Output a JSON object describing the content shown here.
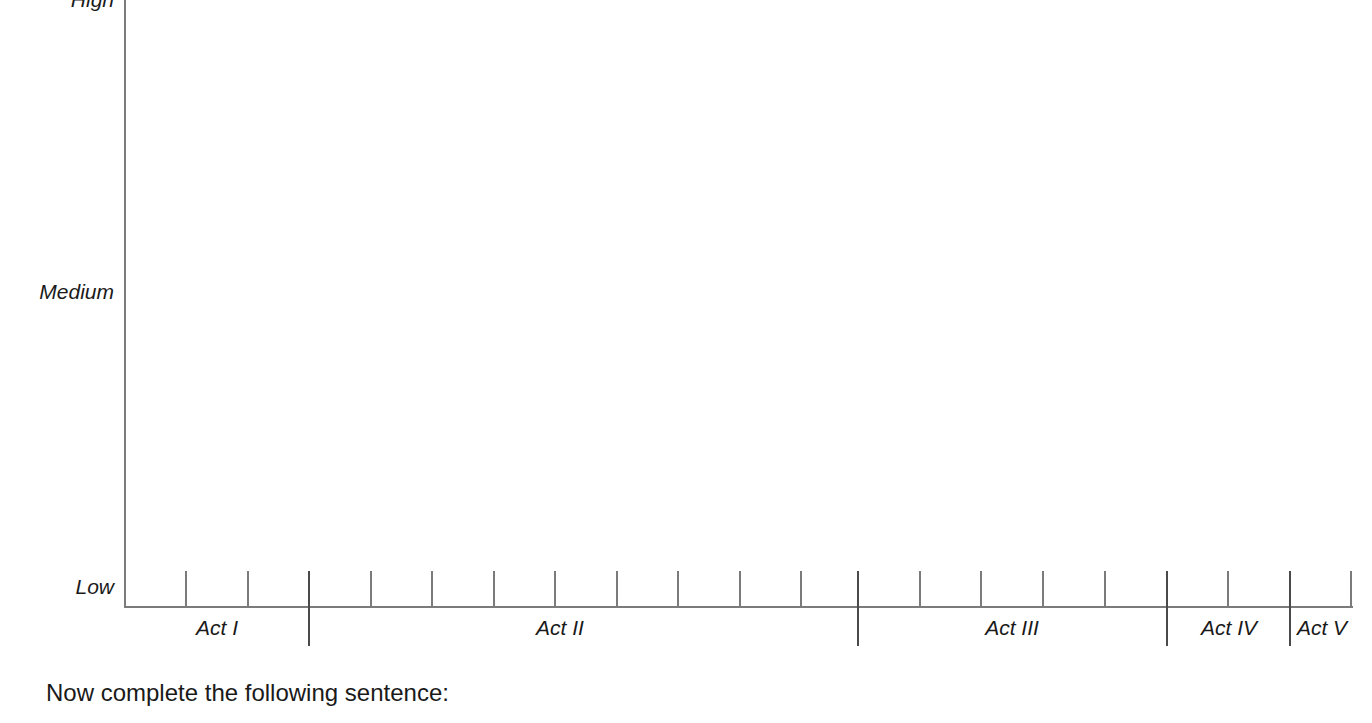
{
  "chart_data": {
    "type": "line",
    "title": "",
    "xlabel": "",
    "ylabel": "",
    "grid": false,
    "legend": null,
    "series": [],
    "y_axis": {
      "type": "categorical",
      "ticks": [
        {
          "label": "High",
          "value": 3
        },
        {
          "label": "Medium",
          "value": 2
        },
        {
          "label": "Low",
          "value": 1
        }
      ],
      "range": [
        "Low",
        "High"
      ]
    },
    "x_axis": {
      "type": "categorical",
      "label": "",
      "act_labels": [
        "Act I",
        "Act II",
        "Act III",
        "Act IV",
        "Act V"
      ],
      "minor_tick_count": 20,
      "act_boundaries": [
        "Act I/Act II",
        "Act II/Act III",
        "Act III/Act IV",
        "Act IV/Act V"
      ]
    },
    "note": "Empty plot area — blank tension/intensity grid for five acts, no data plotted."
  },
  "axis": {
    "y_labels": {
      "high": "High",
      "medium": "Medium",
      "low": "Low"
    },
    "acts": [
      {
        "label": "Act I",
        "center_x": 217
      },
      {
        "label": "Act II",
        "center_x": 560
      },
      {
        "label": "Act III",
        "center_x": 1012
      },
      {
        "label": "Act IV",
        "center_x": 1229
      },
      {
        "label": "Act V",
        "center_x": 1322
      }
    ],
    "minor_ticks_x": [
      186,
      248,
      309,
      371,
      432,
      494,
      555,
      617,
      678,
      740,
      801,
      858,
      920,
      981,
      1043,
      1105,
      1167,
      1228,
      1290,
      1351
    ],
    "major_ticks_x": [
      309,
      858,
      1167,
      1290
    ],
    "colors": {
      "axis_line": "#7b7b7b",
      "major_tick": "#4a4a4a",
      "text": "#1a1a1a",
      "background": "#ffffff"
    }
  },
  "prompt": {
    "text": "Now complete the following sentence:"
  }
}
